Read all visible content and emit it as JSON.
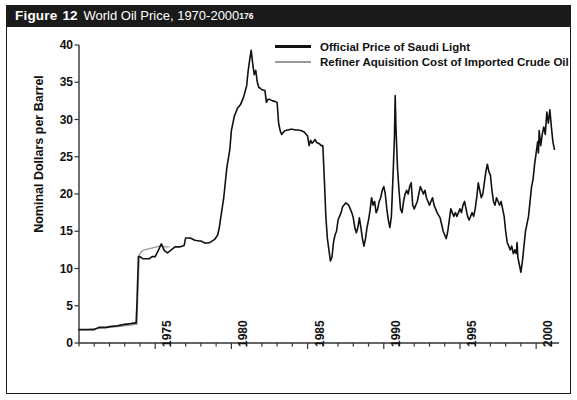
{
  "figure": {
    "label": "Figure",
    "number": "12",
    "title": "World Oil Price, 1970-2000",
    "footnote_marker": "176"
  },
  "colors": {
    "title_bar_bg": "#1a1a1a",
    "title_bar_text": "#ffffff",
    "frame": "#1a1a1a",
    "series_saudi": "#111111",
    "series_refiner": "#9a9a9a",
    "axis": "#333333",
    "background": "#ffffff"
  },
  "chart_data": {
    "type": "line",
    "title": "World Oil Price, 1970-2000",
    "xlabel": "",
    "ylabel": "Nominal Dollars per Barrel",
    "xlim": [
      1970.0,
      2001.5
    ],
    "ylim": [
      0,
      40
    ],
    "yticks": [
      0,
      5,
      10,
      15,
      20,
      25,
      30,
      35,
      40
    ],
    "xticks": [
      1975,
      1980,
      1985,
      1990,
      1995,
      2000
    ],
    "xtick_labels": [
      "1975",
      "1980",
      "1985",
      "1990",
      "1995",
      "2000"
    ],
    "ytick_labels": [
      "0",
      "5",
      "10",
      "15",
      "20",
      "25",
      "30",
      "35",
      "40"
    ],
    "x_minor_tick_interval": 1,
    "grid": false,
    "legend_position": "top-right",
    "series": [
      {
        "name": "Official Price of Saudi Light",
        "color": "#111111",
        "width": 1.6,
        "points": [
          [
            1970.0,
            1.8
          ],
          [
            1970.5,
            1.8
          ],
          [
            1971.0,
            1.8
          ],
          [
            1971.3,
            2.1
          ],
          [
            1971.8,
            2.1
          ],
          [
            1972.0,
            2.2
          ],
          [
            1972.5,
            2.3
          ],
          [
            1973.0,
            2.5
          ],
          [
            1973.4,
            2.6
          ],
          [
            1973.7,
            2.7
          ],
          [
            1973.75,
            2.7
          ],
          [
            1973.8,
            5.1
          ],
          [
            1973.9,
            11.6
          ],
          [
            1974.0,
            11.6
          ],
          [
            1974.2,
            11.3
          ],
          [
            1974.4,
            11.3
          ],
          [
            1974.6,
            11.3
          ],
          [
            1974.8,
            11.6
          ],
          [
            1975.0,
            11.6
          ],
          [
            1975.2,
            12.4
          ],
          [
            1975.4,
            13.3
          ],
          [
            1975.6,
            12.4
          ],
          [
            1975.8,
            12.1
          ],
          [
            1976.0,
            12.4
          ],
          [
            1976.3,
            12.9
          ],
          [
            1976.6,
            12.9
          ],
          [
            1976.9,
            13.1
          ],
          [
            1977.0,
            14.1
          ],
          [
            1977.3,
            14.1
          ],
          [
            1977.6,
            13.8
          ],
          [
            1977.9,
            13.7
          ],
          [
            1978.0,
            13.7
          ],
          [
            1978.3,
            13.4
          ],
          [
            1978.6,
            13.5
          ],
          [
            1978.9,
            13.9
          ],
          [
            1979.0,
            14.2
          ],
          [
            1979.1,
            14.5
          ],
          [
            1979.2,
            15.4
          ],
          [
            1979.3,
            16.8
          ],
          [
            1979.5,
            19.5
          ],
          [
            1979.7,
            23.5
          ],
          [
            1979.9,
            26.0
          ],
          [
            1980.0,
            28.5
          ],
          [
            1980.2,
            30.5
          ],
          [
            1980.4,
            31.5
          ],
          [
            1980.6,
            32.0
          ],
          [
            1980.8,
            33.0
          ],
          [
            1981.0,
            34.5
          ],
          [
            1981.1,
            36.5
          ],
          [
            1981.2,
            38.0
          ],
          [
            1981.3,
            39.3
          ],
          [
            1981.4,
            37.5
          ],
          [
            1981.5,
            36.0
          ],
          [
            1981.6,
            36.6
          ],
          [
            1981.7,
            35.0
          ],
          [
            1981.8,
            34.3
          ],
          [
            1981.9,
            34.2
          ],
          [
            1982.0,
            34.0
          ],
          [
            1982.2,
            33.9
          ],
          [
            1982.3,
            32.3
          ],
          [
            1982.4,
            32.7
          ],
          [
            1982.5,
            32.7
          ],
          [
            1982.7,
            32.5
          ],
          [
            1982.9,
            32.4
          ],
          [
            1983.0,
            32.3
          ],
          [
            1983.1,
            29.5
          ],
          [
            1983.2,
            28.5
          ],
          [
            1983.3,
            28.0
          ],
          [
            1983.5,
            28.5
          ],
          [
            1983.7,
            28.6
          ],
          [
            1983.9,
            28.7
          ],
          [
            1984.0,
            28.7
          ],
          [
            1984.2,
            28.6
          ],
          [
            1984.4,
            28.6
          ],
          [
            1984.6,
            28.5
          ],
          [
            1984.8,
            28.3
          ],
          [
            1985.0,
            27.8
          ],
          [
            1985.1,
            26.5
          ],
          [
            1985.2,
            27.2
          ],
          [
            1985.3,
            26.8
          ],
          [
            1985.5,
            27.3
          ],
          [
            1985.6,
            26.9
          ],
          [
            1985.8,
            26.7
          ],
          [
            1985.9,
            26.5
          ],
          [
            1986.0,
            26.5
          ],
          [
            1986.1,
            22.0
          ],
          [
            1986.2,
            17.0
          ],
          [
            1986.3,
            14.0
          ],
          [
            1986.4,
            12.5
          ],
          [
            1986.5,
            11.0
          ],
          [
            1986.6,
            11.5
          ],
          [
            1986.7,
            13.5
          ],
          [
            1986.8,
            14.5
          ],
          [
            1986.9,
            15.0
          ],
          [
            1987.0,
            16.5
          ],
          [
            1987.2,
            17.5
          ],
          [
            1987.3,
            18.3
          ],
          [
            1987.5,
            18.8
          ],
          [
            1987.7,
            18.5
          ],
          [
            1987.9,
            17.5
          ],
          [
            1988.0,
            16.8
          ],
          [
            1988.1,
            15.5
          ],
          [
            1988.2,
            14.8
          ],
          [
            1988.3,
            15.5
          ],
          [
            1988.4,
            16.8
          ],
          [
            1988.5,
            15.5
          ],
          [
            1988.6,
            14.0
          ],
          [
            1988.7,
            13.0
          ],
          [
            1988.8,
            14.0
          ],
          [
            1988.9,
            15.5
          ],
          [
            1989.0,
            16.5
          ],
          [
            1989.1,
            17.8
          ],
          [
            1989.2,
            19.5
          ],
          [
            1989.3,
            18.5
          ],
          [
            1989.4,
            19.0
          ],
          [
            1989.5,
            17.5
          ],
          [
            1989.6,
            18.0
          ],
          [
            1989.7,
            19.0
          ],
          [
            1989.8,
            19.5
          ],
          [
            1989.9,
            20.5
          ],
          [
            1990.0,
            21.0
          ],
          [
            1990.1,
            20.0
          ],
          [
            1990.2,
            18.0
          ],
          [
            1990.3,
            16.5
          ],
          [
            1990.4,
            15.5
          ],
          [
            1990.5,
            17.0
          ],
          [
            1990.6,
            22.0
          ],
          [
            1990.7,
            27.5
          ],
          [
            1990.75,
            33.2
          ],
          [
            1990.8,
            29.0
          ],
          [
            1990.9,
            23.5
          ],
          [
            1991.0,
            20.5
          ],
          [
            1991.1,
            18.0
          ],
          [
            1991.2,
            17.5
          ],
          [
            1991.3,
            19.0
          ],
          [
            1991.4,
            20.0
          ],
          [
            1991.5,
            20.5
          ],
          [
            1991.6,
            20.0
          ],
          [
            1991.7,
            21.0
          ],
          [
            1991.8,
            21.5
          ],
          [
            1991.9,
            18.5
          ],
          [
            1992.0,
            18.0
          ],
          [
            1992.1,
            18.5
          ],
          [
            1992.2,
            19.0
          ],
          [
            1992.3,
            20.0
          ],
          [
            1992.4,
            21.0
          ],
          [
            1992.5,
            20.5
          ],
          [
            1992.6,
            20.0
          ],
          [
            1992.7,
            20.5
          ],
          [
            1992.8,
            19.5
          ],
          [
            1992.9,
            19.0
          ],
          [
            1993.0,
            18.5
          ],
          [
            1993.2,
            19.5
          ],
          [
            1993.3,
            18.5
          ],
          [
            1993.5,
            17.5
          ],
          [
            1993.7,
            16.8
          ],
          [
            1993.9,
            15.0
          ],
          [
            1994.0,
            14.5
          ],
          [
            1994.1,
            14.0
          ],
          [
            1994.2,
            15.0
          ],
          [
            1994.3,
            16.5
          ],
          [
            1994.4,
            18.0
          ],
          [
            1994.5,
            17.5
          ],
          [
            1994.6,
            17.0
          ],
          [
            1994.7,
            17.5
          ],
          [
            1994.8,
            17.0
          ],
          [
            1994.9,
            17.5
          ],
          [
            1995.0,
            18.0
          ],
          [
            1995.1,
            17.5
          ],
          [
            1995.2,
            18.5
          ],
          [
            1995.3,
            19.0
          ],
          [
            1995.4,
            18.0
          ],
          [
            1995.5,
            17.0
          ],
          [
            1995.6,
            16.5
          ],
          [
            1995.7,
            17.0
          ],
          [
            1995.8,
            17.5
          ],
          [
            1995.9,
            17.0
          ],
          [
            1996.0,
            18.0
          ],
          [
            1996.1,
            19.5
          ],
          [
            1996.2,
            21.5
          ],
          [
            1996.3,
            20.5
          ],
          [
            1996.4,
            19.5
          ],
          [
            1996.5,
            20.0
          ],
          [
            1996.6,
            21.5
          ],
          [
            1996.7,
            23.0
          ],
          [
            1996.8,
            24.0
          ],
          [
            1996.9,
            23.0
          ],
          [
            1997.0,
            22.5
          ],
          [
            1997.1,
            20.5
          ],
          [
            1997.2,
            19.0
          ],
          [
            1997.3,
            18.5
          ],
          [
            1997.4,
            19.5
          ],
          [
            1997.5,
            19.0
          ],
          [
            1997.6,
            18.5
          ],
          [
            1997.7,
            19.0
          ],
          [
            1997.8,
            18.0
          ],
          [
            1997.9,
            17.0
          ],
          [
            1998.0,
            15.0
          ],
          [
            1998.1,
            13.5
          ],
          [
            1998.2,
            13.0
          ],
          [
            1998.3,
            12.5
          ],
          [
            1998.4,
            13.0
          ],
          [
            1998.5,
            12.0
          ],
          [
            1998.6,
            12.5
          ],
          [
            1998.7,
            12.0
          ],
          [
            1998.75,
            13.5
          ],
          [
            1998.8,
            11.5
          ],
          [
            1998.9,
            10.5
          ],
          [
            1999.0,
            9.5
          ],
          [
            1999.1,
            11.0
          ],
          [
            1999.2,
            13.0
          ],
          [
            1999.3,
            15.0
          ],
          [
            1999.4,
            16.0
          ],
          [
            1999.5,
            17.0
          ],
          [
            1999.6,
            19.0
          ],
          [
            1999.7,
            21.0
          ],
          [
            1999.8,
            22.0
          ],
          [
            1999.9,
            24.0
          ],
          [
            2000.0,
            25.5
          ],
          [
            2000.1,
            27.0
          ],
          [
            2000.15,
            25.5
          ],
          [
            2000.2,
            28.5
          ],
          [
            2000.3,
            26.5
          ],
          [
            2000.4,
            28.0
          ],
          [
            2000.5,
            29.0
          ],
          [
            2000.6,
            28.0
          ],
          [
            2000.7,
            31.0
          ],
          [
            2000.8,
            29.5
          ],
          [
            2000.9,
            31.3
          ],
          [
            2001.0,
            29.0
          ],
          [
            2001.1,
            27.0
          ],
          [
            2001.2,
            26.0
          ]
        ]
      },
      {
        "name": "Refiner Aquisition Cost of Imported Crude Oil",
        "color": "#9a9a9a",
        "width": 1.4,
        "points": [
          [
            1970.0,
            1.8
          ],
          [
            1970.5,
            1.8
          ],
          [
            1971.0,
            1.9
          ],
          [
            1971.5,
            2.0
          ],
          [
            1972.0,
            2.1
          ],
          [
            1972.5,
            2.2
          ],
          [
            1973.0,
            2.3
          ],
          [
            1973.4,
            2.4
          ],
          [
            1973.7,
            2.5
          ],
          [
            1973.8,
            2.5
          ],
          [
            1973.85,
            6.0
          ],
          [
            1973.95,
            11.8
          ],
          [
            1974.1,
            12.3
          ],
          [
            1974.3,
            12.5
          ],
          [
            1974.5,
            12.6
          ],
          [
            1974.7,
            12.7
          ],
          [
            1974.9,
            12.8
          ],
          [
            1975.1,
            12.9
          ],
          [
            1975.3,
            13.0
          ],
          [
            1975.5,
            13.0
          ],
          [
            1975.7,
            12.9
          ],
          [
            1975.9,
            12.9
          ]
        ]
      }
    ]
  },
  "axes": {
    "y_title": "Nominal Dollars per Barrel"
  },
  "legend": {
    "entries": [
      {
        "label": "Official Price of Saudi Light",
        "swatch": "black-line"
      },
      {
        "label": "Refiner Aquisition Cost of Imported Crude Oil",
        "swatch": "gray-line"
      }
    ]
  }
}
